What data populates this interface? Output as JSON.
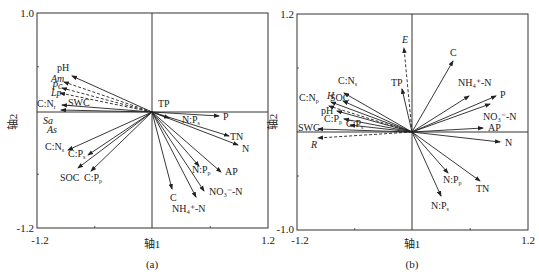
{
  "chart_data": [
    {
      "type": "biplot",
      "panel_label": "(a)",
      "xlabel": "轴1",
      "ylabel": "轴2",
      "xlim": [
        -1.2,
        1.2
      ],
      "ylim": [
        -1.2,
        1.0
      ],
      "tick_labels": {
        "x_min": "-1.2",
        "x_max": "1.2",
        "y_min": "-1.2",
        "y_max": "1.0"
      },
      "box": {
        "x0": 37,
        "y0": 13,
        "x1": 268,
        "y1": 228,
        "ox": 152,
        "oy": 112
      },
      "solid_arrows": [
        {
          "label": "pH",
          "x2": 72,
          "y2": 76,
          "lx": 57,
          "ly": 71
        },
        {
          "label": "SWC",
          "x2": 62,
          "y2": 105,
          "lx": 68,
          "ly": 106
        },
        {
          "label": "C:N_r",
          "x2": 61,
          "y2": 110,
          "lx": 37,
          "ly": 107
        },
        {
          "label": "TP",
          "x2": 152,
          "y2": 112,
          "lx": 158,
          "ly": 107
        },
        {
          "label": "P",
          "x2": 219,
          "y2": 116,
          "lx": 223,
          "ly": 120
        },
        {
          "label": "N:P_s",
          "x2": 169,
          "y2": 118,
          "lx": 182,
          "ly": 123
        },
        {
          "label": "TN",
          "x2": 229,
          "y2": 136,
          "lx": 230,
          "ly": 140
        },
        {
          "label": "N",
          "x2": 238,
          "y2": 145,
          "lx": 242,
          "ly": 152
        },
        {
          "label": "AP",
          "x2": 221,
          "y2": 172,
          "lx": 225,
          "ly": 175
        },
        {
          "label": "N:P_p",
          "x2": 199,
          "y2": 166,
          "lx": 192,
          "ly": 173
        },
        {
          "label": "NO₃⁻-N",
          "x2": 204,
          "y2": 191,
          "lx": 209,
          "ly": 195
        },
        {
          "label": "NH₄⁺-N",
          "x2": 196,
          "y2": 197,
          "lx": 172,
          "ly": 212
        },
        {
          "label": "C",
          "x2": 172,
          "y2": 189,
          "lx": 170,
          "ly": 201
        },
        {
          "label": "C:N_s",
          "x2": 68,
          "y2": 150,
          "lx": 45,
          "ly": 150
        },
        {
          "label": "C:P_s",
          "x2": 88,
          "y2": 155,
          "lx": 68,
          "ly": 157
        },
        {
          "label": "SOC",
          "x2": 78,
          "y2": 168,
          "lx": 60,
          "ly": 181
        },
        {
          "label": "C:P_p",
          "x2": 91,
          "y2": 171,
          "lx": 84,
          "ly": 181
        }
      ],
      "dashed_arrows": [
        {
          "label": "Am",
          "x2": 64,
          "y2": 82,
          "lx": 51,
          "ly": 82
        },
        {
          "label": "Pc",
          "x2": 62,
          "y2": 88,
          "lx": 52,
          "ly": 89
        },
        {
          "label": "Lp",
          "x2": 60,
          "y2": 93,
          "lx": 51,
          "ly": 96
        }
      ],
      "side_labels": [
        {
          "label": "Sa",
          "lx": 43,
          "ly": 124
        },
        {
          "label": "As",
          "lx": 47,
          "ly": 133
        }
      ]
    },
    {
      "type": "biplot",
      "panel_label": "(b)",
      "xlabel": "轴1",
      "ylabel": "轴2",
      "xlim": [
        -1.2,
        1.2
      ],
      "ylim": [
        -1.0,
        1.2
      ],
      "tick_labels": {
        "x_min": "-1.2",
        "x_max": "1.2",
        "y_min": "-1.0",
        "y_max": "1.2"
      },
      "box": {
        "x0": 297,
        "y0": 14,
        "x1": 528,
        "y1": 230,
        "ox": 412,
        "oy": 132
      },
      "solid_arrows": [
        {
          "label": "C",
          "x2": 453,
          "y2": 61,
          "lx": 450,
          "ly": 56
        },
        {
          "label": "TP",
          "x2": 402,
          "y2": 89,
          "lx": 391,
          "ly": 86
        },
        {
          "label": "NH₄⁺-N",
          "x2": 469,
          "y2": 96,
          "lx": 458,
          "ly": 86
        },
        {
          "label": "P",
          "x2": 496,
          "y2": 96,
          "lx": 500,
          "ly": 98
        },
        {
          "label": "NO₃⁻-N",
          "x2": 490,
          "y2": 104,
          "lx": 483,
          "ly": 120
        },
        {
          "label": "AP",
          "x2": 483,
          "y2": 128,
          "lx": 488,
          "ly": 131
        },
        {
          "label": "N",
          "x2": 500,
          "y2": 142,
          "lx": 505,
          "ly": 146
        },
        {
          "label": "N:P_p",
          "x2": 448,
          "y2": 173,
          "lx": 443,
          "ly": 183
        },
        {
          "label": "TN",
          "x2": 480,
          "y2": 181,
          "lx": 476,
          "ly": 192
        },
        {
          "label": "N:P_s",
          "x2": 441,
          "y2": 196,
          "lx": 431,
          "ly": 209
        },
        {
          "label": "C:N_s",
          "x2": 344,
          "y2": 93,
          "lx": 338,
          "ly": 84
        },
        {
          "label": "SOC",
          "x2": 343,
          "y2": 101,
          "lx": 330,
          "ly": 101
        },
        {
          "label": "C:N_p",
          "x2": 331,
          "y2": 102,
          "lx": 299,
          "ly": 101
        },
        {
          "label": "pH",
          "x2": 337,
          "y2": 111,
          "lx": 321,
          "ly": 114
        },
        {
          "label": "C:P_p",
          "x2": 344,
          "y2": 119,
          "lx": 324,
          "ly": 122
        },
        {
          "label": "C:P_s",
          "x2": 350,
          "y2": 125,
          "lx": 346,
          "ly": 127
        },
        {
          "label": "SWC",
          "x2": 318,
          "y2": 129,
          "lx": 298,
          "ly": 131
        }
      ],
      "dashed_arrows": [
        {
          "label": "E",
          "x2": 404,
          "y2": 48,
          "lx": 402,
          "ly": 43
        },
        {
          "label": "H",
          "x2": 329,
          "y2": 106,
          "lx": 327,
          "ly": 99
        },
        {
          "label": "R",
          "x2": 318,
          "y2": 138,
          "lx": 311,
          "ly": 148
        }
      ],
      "side_labels": []
    }
  ]
}
